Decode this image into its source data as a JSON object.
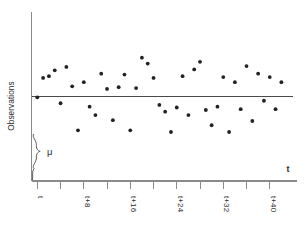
{
  "chart_data": {
    "type": "scatter",
    "title": "",
    "subtitle": "",
    "xlabel": "t",
    "ylabel": "Observations",
    "grid": false,
    "legend_position": "none",
    "x_tick_labels": [
      "t",
      "",
      "t+8",
      "",
      "t+16",
      "",
      "t+24",
      "",
      "t+32",
      "",
      "t+40"
    ],
    "x_tick_values": [
      0,
      4,
      8,
      12,
      16,
      20,
      24,
      28,
      32,
      36,
      40
    ],
    "xlim": [
      -1,
      44
    ],
    "ylim": [
      0,
      10
    ],
    "annotations": [
      {
        "name": "mean-level-brace",
        "label": "μ",
        "description": "curly brace from baseline up to the process mean line"
      }
    ],
    "reference_lines": [
      {
        "name": "process-mean-line",
        "orientation": "horizontal",
        "value": 5.0,
        "label": "μ"
      }
    ],
    "series": [
      {
        "name": "observations",
        "marker": "circle",
        "color": "#222222",
        "x": [
          0,
          1,
          2,
          3,
          4,
          5,
          6,
          7,
          8,
          9,
          10,
          11,
          12,
          13,
          14,
          15,
          16,
          17,
          18,
          19,
          20,
          21,
          22,
          23,
          24,
          25,
          26,
          27,
          28,
          29,
          30,
          31,
          32,
          33,
          34,
          35,
          36,
          37,
          38,
          39,
          40,
          41,
          42
        ],
        "y": [
          4.95,
          6.1,
          6.2,
          6.55,
          4.6,
          6.75,
          5.6,
          3.0,
          5.85,
          4.4,
          3.9,
          6.35,
          5.45,
          3.6,
          5.55,
          6.3,
          3.0,
          5.5,
          7.3,
          6.95,
          6.1,
          4.5,
          4.1,
          2.9,
          4.35,
          6.2,
          3.9,
          6.6,
          7.05,
          4.2,
          3.3,
          4.4,
          6.15,
          2.9,
          5.85,
          4.25,
          6.8,
          3.55,
          6.35,
          4.75,
          6.15,
          4.25,
          5.85
        ]
      }
    ]
  },
  "figure": {
    "axis_color": "#8a8a8a",
    "mean_line_color": "#4a4a4a",
    "point_color": "#222222",
    "background": "#ffffff"
  }
}
